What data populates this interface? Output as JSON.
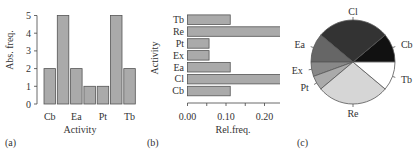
{
  "chart_data": [
    {
      "panel_label": "(a)",
      "type": "bar",
      "orientation": "vertical",
      "categories": [
        "Cb",
        "Cl",
        "Ea",
        "Ex",
        "Pt",
        "Re",
        "Tb"
      ],
      "visible_tick_labels": [
        "Cb",
        "Ea",
        "Pt",
        "Tb"
      ],
      "values": [
        2,
        5,
        2,
        1,
        1,
        5,
        2
      ],
      "xlabel": "Activity",
      "ylabel": "Abs. freq.",
      "yticks": [
        "0",
        "1",
        "2",
        "3",
        "4",
        "5"
      ],
      "ylim": [
        0,
        5
      ],
      "bar_color": "#aaaaaa",
      "grid": false
    },
    {
      "panel_label": "(b)",
      "type": "bar",
      "orientation": "horizontal",
      "categories": [
        "Cb",
        "Cl",
        "Ea",
        "Ex",
        "Pt",
        "Re",
        "Tb"
      ],
      "values": [
        0.111,
        0.278,
        0.111,
        0.056,
        0.056,
        0.278,
        0.111
      ],
      "xlabel": "Rel.freq.",
      "ylabel": "Activity",
      "xticks": [
        "0.00",
        "0.10",
        "0.20"
      ],
      "xlim": [
        0,
        0.28
      ],
      "bar_color": "#aaaaaa",
      "grid": false
    },
    {
      "panel_label": "(c)",
      "type": "pie",
      "labels": [
        "Cb",
        "Cl",
        "Ea",
        "Ex",
        "Pt",
        "Re",
        "Tb"
      ],
      "values": [
        2,
        5,
        2,
        1,
        1,
        5,
        2
      ],
      "colors": [
        "#111111",
        "#333333",
        "#666666",
        "#888888",
        "#aaaaaa",
        "#d6d6d6",
        "#ffffff"
      ]
    }
  ]
}
